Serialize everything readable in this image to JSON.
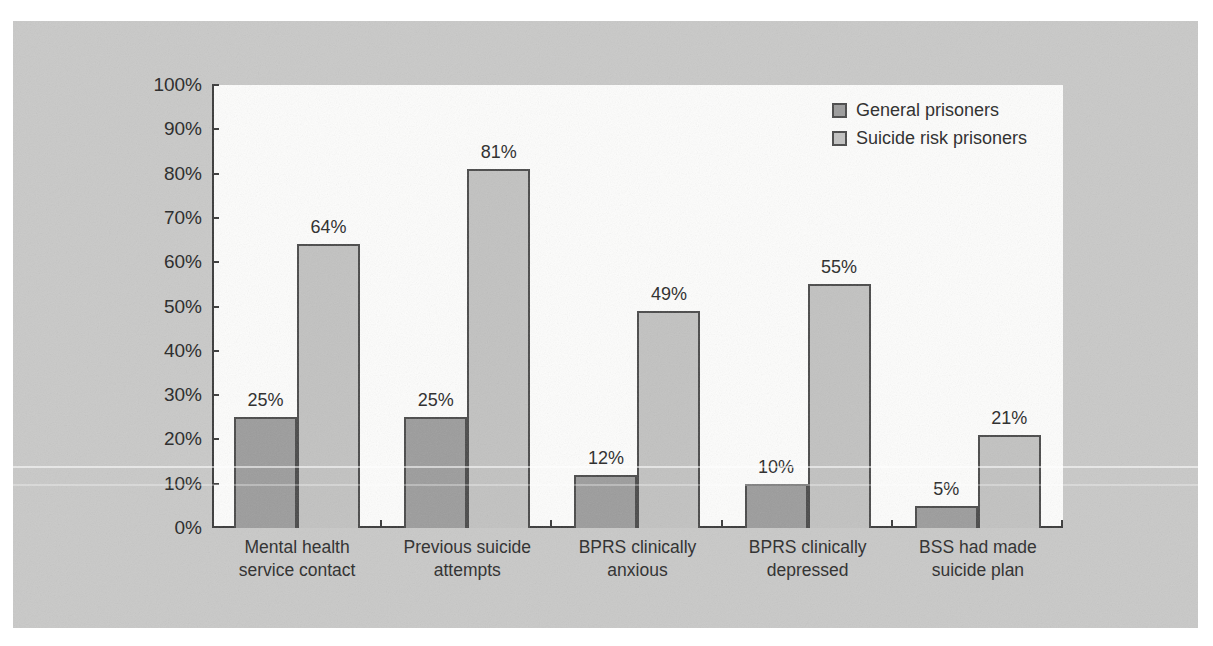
{
  "chart_data": {
    "type": "bar",
    "categories": [
      [
        "Mental health",
        "service contact"
      ],
      [
        "Previous suicide",
        "attempts"
      ],
      [
        "BPRS clinically",
        "anxious"
      ],
      [
        "BPRS clinically",
        "depressed"
      ],
      [
        "BSS had made",
        "suicide plan"
      ]
    ],
    "series": [
      {
        "name": "General prisoners",
        "color": "#9c9c9c",
        "values": [
          25,
          25,
          12,
          10,
          5
        ]
      },
      {
        "name": "Suicide risk prisoners",
        "color": "#c2c2c1",
        "values": [
          64,
          81,
          49,
          55,
          21
        ]
      }
    ],
    "value_label_suffix": "%",
    "y_tick_labels": [
      "0%",
      "10%",
      "20%",
      "30%",
      "40%",
      "50%",
      "60%",
      "70%",
      "80%",
      "90%",
      "100%"
    ],
    "ylim": [
      0,
      100
    ],
    "title": "",
    "xlabel": "",
    "ylabel": "",
    "grid": false,
    "legend_position": "top-right"
  },
  "colors": {
    "panel_background": "#c9c9c8",
    "plot_background": "#fdfdfc",
    "axis": "#3a3a3a",
    "bar_border": "#4a4a4a",
    "text": "#2a2a2a"
  }
}
